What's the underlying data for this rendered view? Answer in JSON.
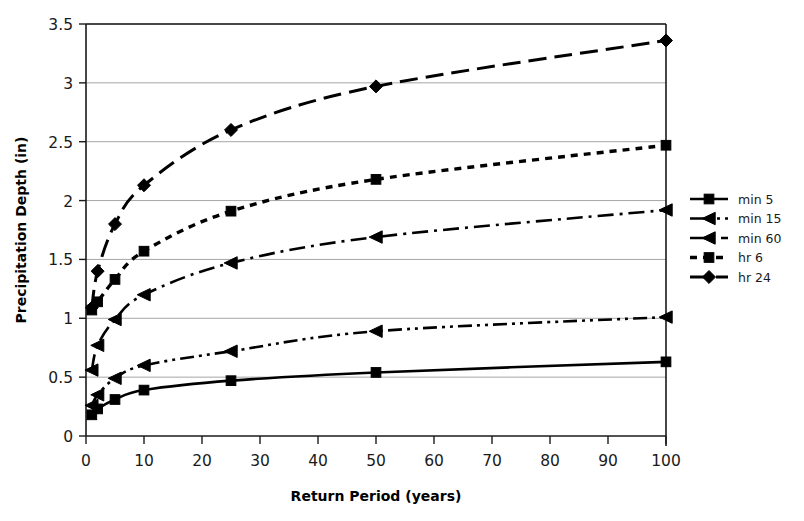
{
  "chart_data": {
    "type": "line",
    "title": "",
    "xlabel": "Return Period (years)",
    "ylabel": "Precipitation Depth (in)",
    "xlim": [
      0,
      100
    ],
    "ylim": [
      0,
      3.5
    ],
    "xticks": [
      0,
      10,
      20,
      30,
      40,
      50,
      60,
      70,
      80,
      90,
      100
    ],
    "yticks": [
      0,
      0.5,
      1,
      1.5,
      2,
      2.5,
      3,
      3.5
    ],
    "xtick_labels": [
      "0",
      "10",
      "20",
      "30",
      "40",
      "50",
      "60",
      "70",
      "80",
      "90",
      "100"
    ],
    "ytick_labels": [
      "0",
      "0.5",
      "1",
      "1.5",
      "2",
      "2.5",
      "3",
      "3.5"
    ],
    "grid": "horizontal",
    "legend_position": "right",
    "x": [
      1,
      2,
      5,
      10,
      25,
      50,
      100
    ],
    "series": [
      {
        "name": "min 5",
        "marker": "square",
        "dash": "solid",
        "values": [
          0.18,
          0.23,
          0.31,
          0.39,
          0.47,
          0.54,
          0.63
        ]
      },
      {
        "name": "min 15",
        "marker": "triangle",
        "dash": "dash-dot-dot",
        "values": [
          0.26,
          0.35,
          0.49,
          0.6,
          0.72,
          0.89,
          1.01
        ]
      },
      {
        "name": "min 60",
        "marker": "triangle",
        "dash": "dash-dot",
        "values": [
          0.56,
          0.77,
          0.99,
          1.2,
          1.47,
          1.69,
          1.92
        ]
      },
      {
        "name": "hr 6",
        "marker": "square",
        "dash": "dotted",
        "values": [
          1.07,
          1.14,
          1.33,
          1.57,
          1.91,
          2.18,
          2.47
        ]
      },
      {
        "name": "hr 24",
        "marker": "diamond",
        "dash": "long-dash",
        "values": [
          1.09,
          1.4,
          1.8,
          2.13,
          2.6,
          2.97,
          3.36
        ]
      }
    ]
  },
  "legend": {
    "items": [
      {
        "label": "min 5"
      },
      {
        "label": "min 15"
      },
      {
        "label": "min 60"
      },
      {
        "label": "hr 6"
      },
      {
        "label": "hr 24"
      }
    ]
  }
}
